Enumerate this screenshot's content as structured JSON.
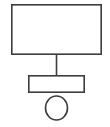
{
  "canvas": {
    "width": 110,
    "height": 127,
    "background_color": "#ffffff",
    "stroke_color": "#3c3c3c",
    "fill_color": "#ffffff"
  },
  "diagram": {
    "type": "block-diagram",
    "title": "",
    "shapes": [
      {
        "id": "top-rectangle",
        "kind": "rectangle",
        "label": "",
        "x": 11,
        "y": 4,
        "width": 91,
        "height": 51,
        "stroke_width": 1.6
      },
      {
        "id": "middle-rectangle",
        "kind": "rectangle",
        "label": "",
        "x": 28,
        "y": 75,
        "width": 57,
        "height": 18,
        "stroke_width": 1.6
      },
      {
        "id": "bottom-ellipse",
        "kind": "ellipse",
        "label": "",
        "cx": 56.5,
        "cy": 108,
        "rx": 11,
        "ry": 12,
        "stroke_width": 1.6
      }
    ],
    "connectors": [
      {
        "id": "top-to-middle-connector",
        "kind": "line",
        "from": "top-rectangle",
        "to": "middle-rectangle",
        "x1": 56.5,
        "y1": 55,
        "x2": 56.5,
        "y2": 75,
        "stroke_width": 1.6
      }
    ]
  }
}
